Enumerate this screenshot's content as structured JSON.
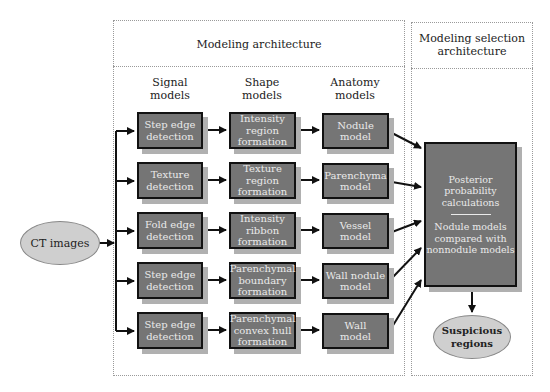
{
  "sections": {
    "modeling_architecture": {
      "title": "Modeling architecture"
    },
    "selection_architecture": {
      "title_line1": "Modeling selection",
      "title_line2": "architecture"
    }
  },
  "columns": [
    {
      "line1": "Signal",
      "line2": "models"
    },
    {
      "line1": "Shape",
      "line2": "models"
    },
    {
      "line1": "Anatomy",
      "line2": "models"
    }
  ],
  "input": {
    "label": "CT images"
  },
  "rows": [
    {
      "signal": [
        "Step edge",
        "detection"
      ],
      "shape": [
        "Intensity",
        "region",
        "formation"
      ],
      "anatomy": [
        "Nodule",
        "model"
      ]
    },
    {
      "signal": [
        "Texture",
        "detection"
      ],
      "shape": [
        "Texture",
        "region",
        "formation"
      ],
      "anatomy": [
        "Parenchyma",
        "model"
      ]
    },
    {
      "signal": [
        "Fold edge",
        "detection"
      ],
      "shape": [
        "Intensity",
        "ribbon",
        "formation"
      ],
      "anatomy": [
        "Vessel",
        "model"
      ]
    },
    {
      "signal": [
        "Step edge",
        "detection"
      ],
      "shape": [
        "Parenchymal",
        "boundary",
        "formation"
      ],
      "anatomy": [
        "Wall nodule",
        "model"
      ]
    },
    {
      "signal": [
        "Step edge",
        "detection"
      ],
      "shape": [
        "Parenchymal",
        "convex hull",
        "formation"
      ],
      "anatomy": [
        "Wall",
        "model"
      ]
    }
  ],
  "selection_box": {
    "top": [
      "Posterior",
      "probability",
      "calculations"
    ],
    "bottom": [
      "Nodule models",
      "compared with",
      "nonnodule models"
    ]
  },
  "output": {
    "line1": "Suspicious",
    "line2": "regions"
  },
  "colors": {
    "box_fill": "#757575",
    "box_border": "#111111",
    "shadow": "#b0b0b0",
    "ellipse_fill": "#cfcfcf",
    "dashed": "#9a9a9a"
  }
}
